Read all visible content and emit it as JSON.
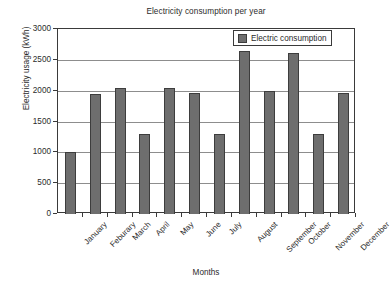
{
  "chart_data": {
    "type": "bar",
    "title": "Electricity consumption per year",
    "xlabel": "Months",
    "ylabel": "Electricity usage (kWh)",
    "categories": [
      "January",
      "Feburary",
      "March",
      "April",
      "May",
      "June",
      "July",
      "August",
      "September",
      "October",
      "November",
      "December"
    ],
    "values": [
      1000,
      1950,
      2050,
      1300,
      2050,
      1970,
      1300,
      2650,
      1990,
      2610,
      1290,
      1960
    ],
    "series": [
      {
        "name": "Electric consumption",
        "values": [
          1000,
          1950,
          2050,
          1300,
          2050,
          1970,
          1300,
          2650,
          1990,
          2610,
          1290,
          1960
        ]
      }
    ],
    "ylim": [
      0,
      3000
    ],
    "yticks": [
      0,
      500,
      1000,
      1500,
      2000,
      2500,
      3000
    ],
    "ytick_labels": [
      "0",
      "500",
      "1000",
      "1500",
      "2000",
      "2500",
      "3000"
    ],
    "grid": "horizontal",
    "legend_position": "top-right",
    "bar_color": "#6e6e6e",
    "bar_edge_color": "#3d3d3d",
    "axis_color": "#3a3a3a",
    "gridline_color": "#8d8d8d",
    "background_color": "#ffffff"
  },
  "legend": {
    "entries": [
      {
        "label": "Electric consumption",
        "color": "#6e6e6e"
      }
    ]
  }
}
